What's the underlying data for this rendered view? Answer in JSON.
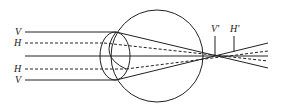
{
  "diagram": {
    "labels": {
      "v_top": "V",
      "h_top": "H",
      "h_bottom": "H",
      "v_bottom": "V",
      "v_prime": "V'",
      "h_prime": "H'"
    },
    "colors": {
      "stroke": "#222222",
      "background": "#ffffff"
    }
  }
}
